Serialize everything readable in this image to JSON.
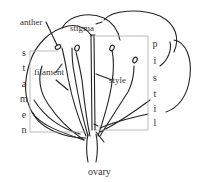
{
  "diagram": {
    "labels": {
      "anther": "anther",
      "stigma": "stigma",
      "filament": "filament",
      "style": "style",
      "caption": "ovary"
    },
    "stamen_letters": [
      "s",
      "t",
      "a",
      "m",
      "e",
      "n"
    ],
    "pistil_letters": [
      "p",
      "i",
      "s",
      "t",
      "i",
      "l"
    ],
    "colors": {
      "stroke": "#222222",
      "bracket": "#aaaaaa",
      "text": "#333333"
    }
  }
}
